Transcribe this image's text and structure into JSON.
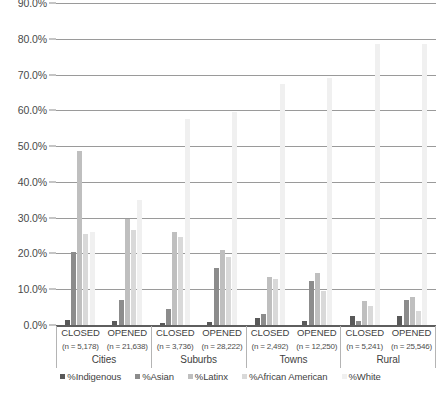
{
  "chart_data": {
    "type": "bar",
    "title": "",
    "xlabel": "",
    "ylabel": "",
    "ylim": [
      0,
      90
    ],
    "grid": true,
    "legend_position": "bottom",
    "ytick_labels": [
      "0.0%",
      "10.0%",
      "20.0%",
      "30.0%",
      "40.0%",
      "50.0%",
      "60.0%",
      "70.0%",
      "80.0%",
      "90.0%"
    ],
    "ytick_values": [
      0,
      10,
      20,
      30,
      40,
      50,
      60,
      70,
      80,
      90
    ],
    "categories": [
      "CLOSED (n = 5,178)",
      "OPENED (n = 21,638)",
      "CLOSED (n = 3,736)",
      "OPENED (n = 28,222)",
      "CLOSED (n = 2,492)",
      "OPENED (n = 12,250)",
      "CLOSED (n = 5,241)",
      "OPENED (n = 25,546)"
    ],
    "group_labels": [
      "Cities",
      "Suburbs",
      "Towns",
      "Rural"
    ],
    "groups": [
      {
        "locale": "Cities",
        "columns": [
          {
            "status": "CLOSED",
            "n": "(n = 5,178)"
          },
          {
            "status": "OPENED",
            "n": "(n = 21,638)"
          }
        ]
      },
      {
        "locale": "Suburbs",
        "columns": [
          {
            "status": "CLOSED",
            "n": "(n = 3,736)"
          },
          {
            "status": "OPENED",
            "n": "(n = 28,222)"
          }
        ]
      },
      {
        "locale": "Towns",
        "columns": [
          {
            "status": "CLOSED",
            "n": "(n = 2,492)"
          },
          {
            "status": "OPENED",
            "n": "(n = 12,250)"
          }
        ]
      },
      {
        "locale": "Rural",
        "columns": [
          {
            "status": "CLOSED",
            "n": "(n = 5,241)"
          },
          {
            "status": "OPENED",
            "n": "(n = 25,546)"
          }
        ]
      }
    ],
    "series": [
      {
        "name": "%Indigenous",
        "color": "#595959",
        "values": [
          1.5,
          1.0,
          0.6,
          0.8,
          1.9,
          1.1,
          2.6,
          2.4
        ]
      },
      {
        "name": "%Asian",
        "color": "#8c8c8c",
        "values": [
          20.5,
          7.0,
          4.5,
          15.8,
          3.2,
          12.2,
          1.2,
          7.0
        ]
      },
      {
        "name": "%Latinx",
        "color": "#bfbfbf",
        "values": [
          48.5,
          29.5,
          26.0,
          21.0,
          13.5,
          14.5,
          6.8,
          7.9
        ]
      },
      {
        "name": "%African American",
        "color": "#d9d9d9",
        "values": [
          25.5,
          26.5,
          24.5,
          19.0,
          13.0,
          9.5,
          5.2,
          3.8
        ]
      },
      {
        "name": "%White",
        "color": "#f0f0f0",
        "values": [
          26.0,
          35.0,
          57.5,
          59.5,
          67.5,
          69.0,
          78.5,
          78.5
        ]
      }
    ]
  }
}
